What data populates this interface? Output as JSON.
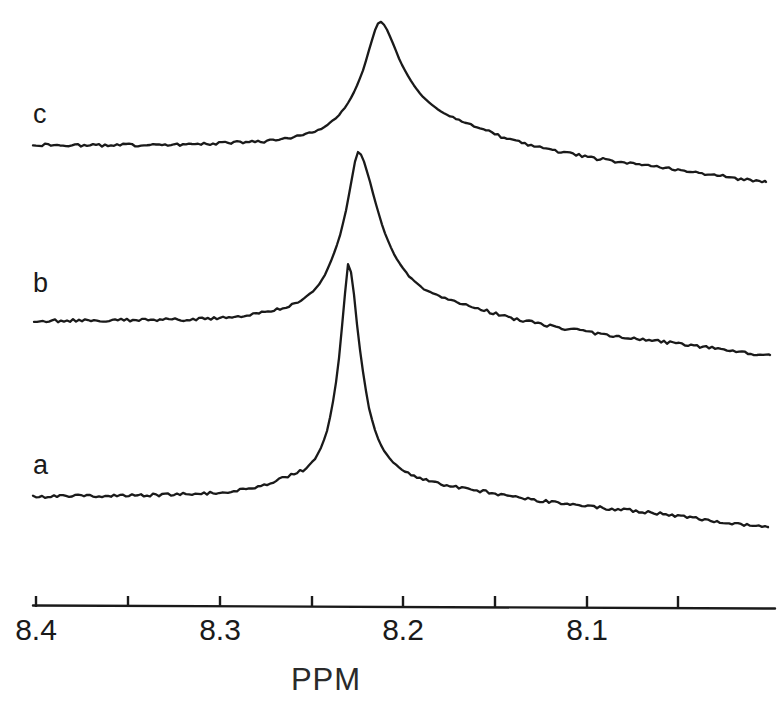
{
  "figure": {
    "type": "nmr-spectrum-stack",
    "background_color": "#ffffff",
    "line_color": "#1a1a1a"
  },
  "axis": {
    "title": "PPM",
    "orientation": "horizontal",
    "direction": "decreasing-left-to-right",
    "line_y": 606,
    "line_x_start": 33,
    "line_x_end": 775,
    "tick_positions_px": [
      36,
      128,
      220,
      312,
      403,
      495,
      587,
      678
    ],
    "tick_values": [
      8.4,
      8.375,
      8.35,
      8.325,
      8.3,
      8.275,
      8.25,
      8.225
    ],
    "labeled_ticks": [
      {
        "label": "8.4",
        "x": 36
      },
      {
        "label": "8.3",
        "x": 220
      },
      {
        "label": "8.2",
        "x": 403
      },
      {
        "label": "8.1",
        "x": 587
      }
    ],
    "ppm_per_pixel": 0.000543478,
    "range_ppm": [
      8.4,
      8.0
    ],
    "grid": false
  },
  "traces": [
    {
      "id": "c",
      "label": "c",
      "label_x": 33,
      "label_y": 101,
      "baseline_y": 146,
      "peak_apex": {
        "x": 378,
        "y": 22,
        "ppm": 8.214
      },
      "peak_height_px": 124,
      "peak_width_px": 150,
      "description": "broadest peak, lowest and widest resonance",
      "start_x": 33,
      "end_x": 766,
      "end_y": 182
    },
    {
      "id": "b",
      "label": "b",
      "label_x": 33,
      "label_y": 270,
      "baseline_y": 322,
      "peak_apex": {
        "x": 358,
        "y": 152,
        "ppm": 8.225
      },
      "peak_height_px": 170,
      "peak_width_px": 86,
      "description": "intermediate linewidth resonance",
      "start_x": 34,
      "end_x": 770,
      "end_y": 355
    },
    {
      "id": "a",
      "label": "a",
      "label_x": 33,
      "label_y": 452,
      "baseline_y": 498,
      "peak_apex": {
        "x": 348,
        "y": 262,
        "ppm": 8.23
      },
      "peak_height_px": 236,
      "peak_width_px": 48,
      "description": "sharpest and tallest narrow resonance with left shoulder",
      "start_x": 33,
      "end_x": 768,
      "end_y": 527
    }
  ],
  "chart_data": {
    "type": "line",
    "title": "",
    "subtitle": "",
    "xlabel": "PPM",
    "ylabel": "",
    "xlim": [
      8.4,
      8.0
    ],
    "ylim": [
      0,
      1
    ],
    "grid": false,
    "legend_position": "inline-left",
    "x_ticks": [
      8.4,
      8.3,
      8.2,
      8.1
    ],
    "x_tick_labels": [
      "8.4",
      "8.3",
      "8.2",
      "8.1"
    ],
    "x_minor_ticks": [
      8.375,
      8.325,
      8.275,
      8.225
    ],
    "series": [
      {
        "name": "c",
        "offset_label": "c",
        "peak_ppm": 8.214,
        "peak_relative_height": 1.0,
        "linewidth_ppm": 0.0815,
        "comment": "broad resonance",
        "points_ppm_amp": [
          [
            8.4,
            0.01
          ],
          [
            8.38,
            0.004
          ],
          [
            8.36,
            0.006
          ],
          [
            8.34,
            0.01
          ],
          [
            8.32,
            0.014
          ],
          [
            8.3,
            0.022
          ],
          [
            8.28,
            0.034
          ],
          [
            8.27,
            0.046
          ],
          [
            8.26,
            0.07
          ],
          [
            8.252,
            0.1
          ],
          [
            8.245,
            0.14
          ],
          [
            8.238,
            0.21
          ],
          [
            8.232,
            0.31
          ],
          [
            8.227,
            0.44
          ],
          [
            8.222,
            0.62
          ],
          [
            8.218,
            0.82
          ],
          [
            8.215,
            0.96
          ],
          [
            8.213,
            1.0
          ],
          [
            8.211,
            0.98
          ],
          [
            8.207,
            0.86
          ],
          [
            8.202,
            0.68
          ],
          [
            8.196,
            0.52
          ],
          [
            8.19,
            0.4
          ],
          [
            8.182,
            0.3
          ],
          [
            8.172,
            0.22
          ],
          [
            8.16,
            0.16
          ],
          [
            8.145,
            0.11
          ],
          [
            8.125,
            0.07
          ],
          [
            8.1,
            0.04
          ],
          [
            8.07,
            0.024
          ],
          [
            8.04,
            0.018
          ],
          [
            8.01,
            0.024
          ]
        ]
      },
      {
        "name": "b",
        "offset_label": "b",
        "peak_ppm": 8.225,
        "peak_relative_height": 1.0,
        "linewidth_ppm": 0.0467,
        "comment": "medium-width resonance",
        "points_ppm_amp": [
          [
            8.4,
            0.005
          ],
          [
            8.38,
            0.008
          ],
          [
            8.36,
            0.01
          ],
          [
            8.34,
            0.012
          ],
          [
            8.32,
            0.014
          ],
          [
            8.305,
            0.02
          ],
          [
            8.295,
            0.03
          ],
          [
            8.285,
            0.042
          ],
          [
            8.275,
            0.058
          ],
          [
            8.266,
            0.082
          ],
          [
            8.258,
            0.115
          ],
          [
            8.251,
            0.165
          ],
          [
            8.245,
            0.24
          ],
          [
            8.24,
            0.35
          ],
          [
            8.235,
            0.5
          ],
          [
            8.231,
            0.68
          ],
          [
            8.228,
            0.86
          ],
          [
            8.226,
            0.97
          ],
          [
            8.225,
            1.0
          ],
          [
            8.223,
            0.975
          ],
          [
            8.22,
            0.88
          ],
          [
            8.216,
            0.72
          ],
          [
            8.211,
            0.54
          ],
          [
            8.205,
            0.39
          ],
          [
            8.198,
            0.28
          ],
          [
            8.19,
            0.2
          ],
          [
            8.178,
            0.14
          ],
          [
            8.163,
            0.092
          ],
          [
            8.143,
            0.058
          ],
          [
            8.118,
            0.036
          ],
          [
            8.085,
            0.022
          ],
          [
            8.05,
            0.018
          ],
          [
            8.015,
            0.022
          ]
        ]
      },
      {
        "name": "a",
        "offset_label": "a",
        "peak_ppm": 8.23,
        "peak_relative_height": 1.0,
        "linewidth_ppm": 0.0261,
        "comment": "narrow sharp resonance with shoulder near 8.26 ppm",
        "points_ppm_amp": [
          [
            8.4,
            0.006
          ],
          [
            8.38,
            0.008
          ],
          [
            8.36,
            0.01
          ],
          [
            8.34,
            0.012
          ],
          [
            8.32,
            0.016
          ],
          [
            8.305,
            0.02
          ],
          [
            8.295,
            0.028
          ],
          [
            8.285,
            0.04
          ],
          [
            8.276,
            0.056
          ],
          [
            8.268,
            0.078
          ],
          [
            8.262,
            0.096
          ],
          [
            8.258,
            0.108
          ],
          [
            8.254,
            0.122
          ],
          [
            8.25,
            0.15
          ],
          [
            8.246,
            0.2
          ],
          [
            8.242,
            0.28
          ],
          [
            8.239,
            0.39
          ],
          [
            8.236,
            0.54
          ],
          [
            8.234,
            0.7
          ],
          [
            8.232,
            0.87
          ],
          [
            8.231,
            0.96
          ],
          [
            8.23,
            1.0
          ],
          [
            8.229,
            0.965
          ],
          [
            8.227,
            0.85
          ],
          [
            8.225,
            0.69
          ],
          [
            8.222,
            0.52
          ],
          [
            8.219,
            0.38
          ],
          [
            8.215,
            0.27
          ],
          [
            8.21,
            0.19
          ],
          [
            8.203,
            0.13
          ],
          [
            8.194,
            0.09
          ],
          [
            8.18,
            0.058
          ],
          [
            8.16,
            0.036
          ],
          [
            8.135,
            0.024
          ],
          [
            8.105,
            0.02
          ],
          [
            8.075,
            0.028
          ],
          [
            8.045,
            0.024
          ],
          [
            8.012,
            0.026
          ]
        ]
      }
    ]
  }
}
